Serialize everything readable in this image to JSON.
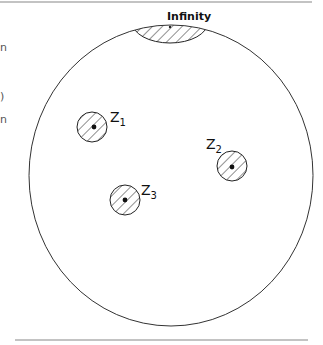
{
  "diagram": {
    "top_label": "Infinity",
    "points": [
      {
        "name": "Z",
        "sub": "1",
        "cx": 92,
        "cy": 127,
        "r": 15,
        "label_x": 110,
        "label_y": 122
      },
      {
        "name": "Z",
        "sub": "2",
        "cx": 232,
        "cy": 166,
        "r": 15,
        "label_x": 206,
        "label_y": 149
      },
      {
        "name": "Z",
        "sub": "3",
        "cx": 125,
        "cy": 200,
        "r": 15,
        "label_x": 141,
        "label_y": 195
      }
    ],
    "colors": {
      "stroke": "#222222",
      "rule": "#888888"
    }
  },
  "left_fragments": [
    "n",
    ")",
    "n"
  ]
}
